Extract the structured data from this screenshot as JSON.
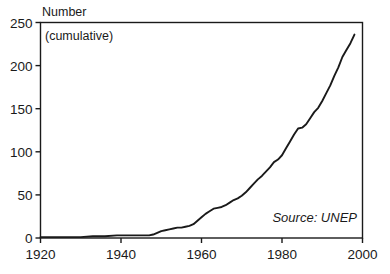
{
  "chart_data": {
    "type": "line",
    "title": "",
    "subtitle": "",
    "ylabel": "Number",
    "ylabel_note": "(cumulative)",
    "xlabel": "",
    "source_note": "Source: UNEP",
    "xlim": [
      1920,
      2000
    ],
    "ylim": [
      0,
      250
    ],
    "grid": false,
    "legend": null,
    "xticks": [
      1920,
      1940,
      1960,
      1980,
      2000
    ],
    "xtick_labels": [
      "1920",
      "1940",
      "1960",
      "1980",
      "2000"
    ],
    "yticks": [
      0,
      50,
      100,
      150,
      200,
      250
    ],
    "ytick_labels": [
      "0",
      "50",
      "100",
      "150",
      "200",
      "250"
    ],
    "line_color": "#1a1a1a",
    "line_width": 1.9,
    "series": [
      {
        "name": "Cumulative number of multilateral environmental agreements",
        "x": [
          1920,
          1925,
          1930,
          1933,
          1936,
          1939,
          1940,
          1942,
          1945,
          1946,
          1947,
          1948,
          1949,
          1950,
          1951,
          1952,
          1953,
          1954,
          1955,
          1956,
          1957,
          1958,
          1959,
          1960,
          1961,
          1962,
          1963,
          1964,
          1965,
          1966,
          1967,
          1968,
          1969,
          1970,
          1971,
          1972,
          1973,
          1974,
          1975,
          1976,
          1977,
          1978,
          1979,
          1980,
          1981,
          1982,
          1983,
          1984,
          1985,
          1986,
          1987,
          1988,
          1989,
          1990,
          1991,
          1992,
          1993,
          1994,
          1995,
          1996,
          1997,
          1998
        ],
        "y": [
          1,
          1,
          1,
          2,
          2,
          3,
          3,
          3,
          3,
          3,
          3,
          4,
          6,
          8,
          9,
          10,
          11,
          12,
          12,
          13,
          14,
          16,
          20,
          24,
          28,
          31,
          34,
          35,
          36,
          38,
          41,
          44,
          46,
          49,
          53,
          58,
          63,
          68,
          72,
          77,
          82,
          88,
          91,
          96,
          104,
          112,
          120,
          127,
          128,
          132,
          139,
          146,
          151,
          159,
          168,
          177,
          188,
          198,
          210,
          218,
          226,
          236
        ]
      }
    ]
  },
  "axis": {
    "y_title": "Number",
    "y_subtitle": "(cumulative)",
    "source": "Source: UNEP"
  }
}
